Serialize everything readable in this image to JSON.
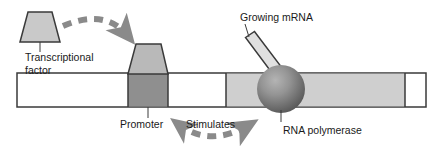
{
  "figure": {
    "width": 444,
    "height": 150,
    "background_color": "#ffffff"
  },
  "labels": {
    "transcriptional_factor_line1": "Transcriptional",
    "transcriptional_factor_line2": "factor",
    "promoter": "Promoter",
    "stimulates": "Stimulates",
    "growing_mrna": "Growing mRNA",
    "rna_polymerase": "RNA polymerase"
  },
  "colors": {
    "outline": "#3a3a3a",
    "text": "#1a1a1a",
    "free_factor_fill": "#c9c9c9",
    "bound_factor_fill": "#b9b9b9",
    "promoter_fill": "#8f8f8f",
    "gene_fill": "#cfcfcf",
    "dna_fill": "#ffffff",
    "mrna_fill": "#e0e0e0",
    "arrow_gray": "#8a8a8a",
    "polymerase_light": "#b0b0b0",
    "polymerase_dark": "#5e5e5e",
    "leader_line": "#3a3a3a"
  },
  "elements": {
    "dna_strand": {
      "name": "DNA double strand",
      "x": 17,
      "y": 73,
      "width": 409,
      "height": 34
    },
    "promoter_region": {
      "name": "Promoter region",
      "x": 128,
      "y": 73,
      "width": 40,
      "height": 34,
      "shade": "dark gray"
    },
    "gene_region": {
      "name": "Transcribed gene region",
      "x": 226,
      "y": 73,
      "width": 179,
      "height": 34,
      "shade": "light gray"
    },
    "free_transcription_factor": {
      "name": "Unbound transcriptional factor",
      "shape": "trapezoid",
      "base_left": 20,
      "base_right": 60,
      "top_left": 28,
      "top_right": 52,
      "top_y": 12,
      "base_y": 42
    },
    "bound_transcription_factor": {
      "name": "Transcriptional factor bound to promoter",
      "shape": "trapezoid",
      "base_left": 128,
      "base_right": 168,
      "top_left": 136,
      "top_right": 161,
      "top_y": 44,
      "base_y": 74
    },
    "rna_polymerase": {
      "name": "RNA polymerase sphere",
      "center_x": 281,
      "center_y": 89,
      "radius": 24
    },
    "growing_mrna": {
      "name": "Growing mRNA strand",
      "shape": "rotated rectangle",
      "from_x": 250,
      "from_y": 40,
      "to_x": 276,
      "to_y": 74,
      "thickness": 11
    },
    "binding_arrow": {
      "name": "Curved dashed arrow from factor to promoter",
      "direction": "left to right, arcing over",
      "style": "dashed"
    },
    "stimulates_arrow": {
      "name": "Curved dashed arrow from promoter toward polymerase",
      "direction": "left to right, arcing under",
      "style": "dashed"
    }
  }
}
